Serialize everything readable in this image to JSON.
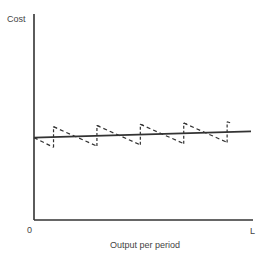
{
  "chart_data": {
    "type": "line",
    "title": "",
    "ylabel": "Cost",
    "xlabel": "Output per period",
    "x_ticks": [
      "0",
      "L"
    ],
    "xlim": [
      0,
      1
    ],
    "ylim": [
      0,
      1
    ],
    "grid": false,
    "legend": "none",
    "series": [
      {
        "name": "average cost (smooth)",
        "style": "solid",
        "x": [
          0,
          1
        ],
        "y": [
          0.4,
          0.43
        ]
      },
      {
        "name": "short-run cost sawtooth",
        "style": "dashed",
        "cycles": 5,
        "cycle_starts": [
          0.09,
          0.29,
          0.49,
          0.69,
          0.89
        ],
        "peak_above_line": 0.05,
        "trough_below_line": 0.05
      }
    ]
  }
}
